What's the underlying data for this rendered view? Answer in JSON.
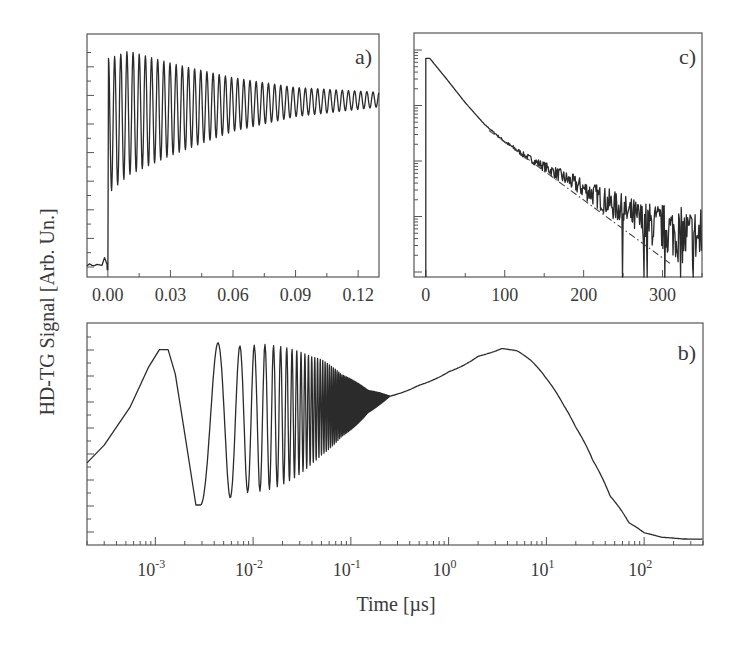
{
  "figure": {
    "ylabel": "HD-TG Signal [Arb. Un.]",
    "xlabel": "Time [µs]"
  },
  "chart_data": [
    {
      "panel": "a)",
      "type": "line",
      "title": "a)",
      "xlabel": "Time [µs]",
      "ylabel": "HD-TG Signal [Arb. Un.]",
      "xscale": "linear",
      "xlim": [
        -0.01,
        0.13
      ],
      "xticks": [
        0.0,
        0.03,
        0.06,
        0.09,
        0.12
      ],
      "xticklabels": [
        "0.00",
        "0.03",
        "0.06",
        "0.09",
        "0.12"
      ],
      "yticklabels": [],
      "grid": false,
      "description": "Baseline near 0.05 before t=0, sharp rise at t=0, then damped oscillation (~44 cycles over 0.13 µs, period ≈ 0.003 µs) whose envelope converges toward ~0.73 of full scale",
      "series": [
        {
          "name": "HD-TG signal",
          "baseline_before_t0": 0.05,
          "oscillation_period_us": 0.00295,
          "envelope_upper": [
            [
              0.001,
              0.9
            ],
            [
              0.01,
              0.93
            ],
            [
              0.03,
              0.88
            ],
            [
              0.06,
              0.82
            ],
            [
              0.09,
              0.78
            ],
            [
              0.13,
              0.76
            ]
          ],
          "envelope_lower": [
            [
              0.001,
              0.35
            ],
            [
              0.01,
              0.42
            ],
            [
              0.03,
              0.5
            ],
            [
              0.06,
              0.6
            ],
            [
              0.09,
              0.66
            ],
            [
              0.13,
              0.7
            ]
          ]
        }
      ]
    },
    {
      "panel": "c)",
      "type": "line",
      "title": "c)",
      "xlabel": "Time [µs]",
      "xscale": "linear",
      "yscale": "log",
      "xlim": [
        -15,
        350
      ],
      "xticks": [
        0,
        100,
        200,
        300
      ],
      "xticklabels": [
        "0",
        "100",
        "200",
        "300"
      ],
      "y_decades_shown": 4,
      "grid": false,
      "description": "Semi-log decay: signal peaks near t≈5 µs, decays exponentially, becomes noisy beyond ~180 µs; dash-dot single-exponential fit line deviates below data after ~90 µs",
      "series": [
        {
          "name": "HD-TG signal (log)",
          "x": [
            0,
            5,
            25,
            50,
            75,
            100,
            125,
            150,
            175,
            200,
            225,
            250,
            275,
            300,
            325,
            350
          ],
          "log10_y_rel": [
            -0.15,
            -0.15,
            -0.5,
            -0.95,
            -1.35,
            -1.65,
            -1.9,
            -2.1,
            -2.3,
            -2.5,
            -2.7,
            -2.9,
            -3.1,
            -3.2,
            -3.35,
            -3.4
          ]
        },
        {
          "name": "exponential fit",
          "style": "dash-dot",
          "x": [
            80,
            310
          ],
          "log10_y_rel": [
            -1.45,
            -3.85
          ]
        }
      ]
    },
    {
      "panel": "b)",
      "type": "line",
      "title": "b)",
      "xlabel": "Time [µs]",
      "xscale": "log",
      "xlim": [
        0.0002,
        400
      ],
      "xticks": [
        0.001,
        0.01,
        0.1,
        1,
        10,
        100
      ],
      "xticklabels": [
        "10^-3",
        "10^-2",
        "10^-1",
        "10^0",
        "10^1",
        "10^2"
      ],
      "grid": false,
      "description": "Log-time full trace: oscillations (acoustic) from 1e-3 to ~0.2 µs converge onto slow rise peaking near 3–4 µs, then decay to baseline by ~200 µs",
      "series": [
        {
          "name": "HD-TG signal",
          "x": [
            0.0002,
            0.0003,
            0.0005,
            0.0011,
            0.0014,
            0.0026,
            0.0039,
            0.0055,
            0.02,
            0.1,
            0.2,
            1,
            3.5,
            5,
            10,
            20,
            40,
            80,
            150,
            400
          ],
          "y_rel": [
            0.37,
            0.45,
            0.62,
            0.88,
            0.85,
            0.18,
            0.9,
            0.28,
            0.85,
            0.68,
            0.66,
            0.8,
            0.88,
            0.86,
            0.72,
            0.52,
            0.26,
            0.07,
            0.03,
            0.02
          ]
        }
      ]
    }
  ]
}
